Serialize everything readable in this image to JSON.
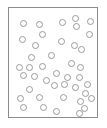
{
  "figure": {
    "type": "scatter-diagram",
    "canvas_width": 107,
    "canvas_height": 128,
    "background_color": "#ffffff"
  },
  "frame": {
    "name": "plot-frame",
    "x": 8,
    "y": 7,
    "width": 90,
    "height": 111,
    "border_width": 1,
    "border_color": "#8c8c8c",
    "fill_color": "#ffffff"
  },
  "marker_style": {
    "shape": "circle",
    "filled": false,
    "stroke_color": "#9a9a9a",
    "stroke_width": 1,
    "diameter": 7
  },
  "chart_data": {
    "type": "scatter",
    "title": "",
    "subtitle": "",
    "xlabel": "",
    "ylabel": "",
    "grid": false,
    "legend": null,
    "axis_ticks": [],
    "tick_labels": [],
    "annotations": [],
    "xlim": [
      8,
      98
    ],
    "ylim": [
      7,
      118
    ],
    "point_count": 41,
    "series": [
      {
        "name": "circles",
        "marker": "open-circle",
        "color": "#9a9a9a",
        "points": [
          {
            "x": 22,
            "y": 22
          },
          {
            "x": 38,
            "y": 23
          },
          {
            "x": 61,
            "y": 21
          },
          {
            "x": 74,
            "y": 17
          },
          {
            "x": 75,
            "y": 25
          },
          {
            "x": 89,
            "y": 20
          },
          {
            "x": 41,
            "y": 33
          },
          {
            "x": 21,
            "y": 38
          },
          {
            "x": 88,
            "y": 33
          },
          {
            "x": 34,
            "y": 44
          },
          {
            "x": 60,
            "y": 40
          },
          {
            "x": 73,
            "y": 44
          },
          {
            "x": 80,
            "y": 48
          },
          {
            "x": 30,
            "y": 56
          },
          {
            "x": 50,
            "y": 54
          },
          {
            "x": 18,
            "y": 66
          },
          {
            "x": 28,
            "y": 66
          },
          {
            "x": 41,
            "y": 65
          },
          {
            "x": 70,
            "y": 62
          },
          {
            "x": 79,
            "y": 66
          },
          {
            "x": 55,
            "y": 72
          },
          {
            "x": 66,
            "y": 76
          },
          {
            "x": 78,
            "y": 76
          },
          {
            "x": 22,
            "y": 74
          },
          {
            "x": 33,
            "y": 75
          },
          {
            "x": 45,
            "y": 79
          },
          {
            "x": 63,
            "y": 83
          },
          {
            "x": 53,
            "y": 84
          },
          {
            "x": 74,
            "y": 86
          },
          {
            "x": 86,
            "y": 83
          },
          {
            "x": 28,
            "y": 88
          },
          {
            "x": 84,
            "y": 92
          },
          {
            "x": 19,
            "y": 97
          },
          {
            "x": 38,
            "y": 96
          },
          {
            "x": 62,
            "y": 96
          },
          {
            "x": 79,
            "y": 100
          },
          {
            "x": 90,
            "y": 97
          },
          {
            "x": 22,
            "y": 106
          },
          {
            "x": 42,
            "y": 106
          },
          {
            "x": 55,
            "y": 110
          },
          {
            "x": 78,
            "y": 112
          },
          {
            "x": 83,
            "y": 107
          }
        ]
      }
    ]
  }
}
